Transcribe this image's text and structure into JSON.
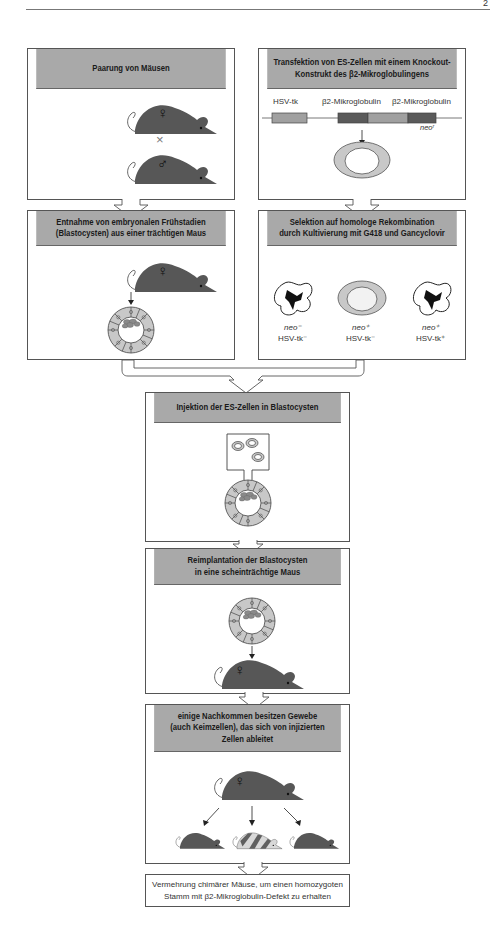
{
  "page": {
    "page_number": "2"
  },
  "steps": {
    "mating": {
      "title": "Paarung von Mäusen",
      "symbol_female": "♀",
      "symbol_male": "♂",
      "cross": "×"
    },
    "transfection": {
      "title_line1": "Transfektion von ES-Zellen mit einem Knockout-",
      "title_line2": "Konstrukt des β2-Mikroglobulingens",
      "gene_labels": [
        "HSV-tk",
        "β2-Mikroglobulin",
        "β2-Mikroglobulin"
      ],
      "neo_label": "neoʳ"
    },
    "harvest": {
      "title_line1": "Entnahme von embryonalen Frühstadien",
      "title_line2": "(Blastocysten) aus einer trächtigen Maus",
      "symbol_female": "♀"
    },
    "selection": {
      "title_line1": "Selektion auf homologe Rekombination",
      "title_line2": "durch Kultivierung mit G418 und Gancyclovir",
      "cells": [
        {
          "neo": "neo⁻",
          "tk": "HSV-tk⁻"
        },
        {
          "neo": "neo⁺",
          "tk": "HSV-tk⁻"
        },
        {
          "neo": "neo⁺",
          "tk": "HSV-tk⁺"
        }
      ]
    },
    "injection": {
      "title": "Injektion der ES-Zellen in Blastocysten"
    },
    "reimplantation": {
      "title_line1": "Reimplantation der Blastocysten",
      "title_line2": "in eine scheinträchtige Maus",
      "symbol_female": "♀"
    },
    "offspring": {
      "title_line1": "einige Nachkommen besitzen Gewebe",
      "title_line2": "(auch Keimzellen), das sich von injizierten",
      "title_line3": "Zellen ableitet",
      "symbol_female": "♀"
    },
    "final": {
      "line1": "Vermehrung chimärer Mäuse, um einen homozygoten",
      "line2": "Stamm mit β2-Mikroglobulin-Defekt zu erhalten"
    }
  },
  "colors": {
    "header_gray": "#a9a9a9",
    "mouse_dark": "#555555",
    "cell_gray": "#c8c8c8",
    "construct_dark": "#5a5a5a",
    "construct_light": "#a0a0a0"
  }
}
